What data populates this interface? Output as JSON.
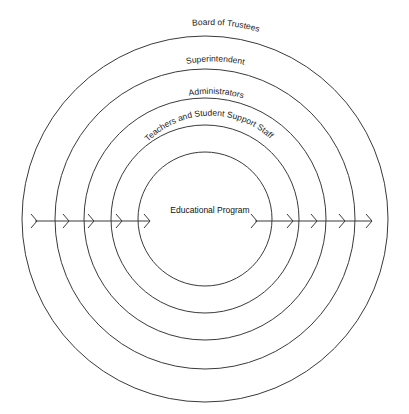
{
  "diagram": {
    "type": "concentric-circles",
    "center": {
      "x": 205,
      "y": 219
    },
    "stroke_color": "#3a3a3a",
    "rings": [
      {
        "label": "Board of Trustees",
        "radius": 183
      },
      {
        "label": "Superintendent",
        "radius": 150
      },
      {
        "label": "Administrators",
        "radius": 121
      },
      {
        "label": "Teachers and Student Support Staff",
        "radius": 94
      }
    ],
    "core": {
      "label": "Educational Program",
      "radius": 67
    },
    "arrows": {
      "direction": "left-to-right",
      "left_segment": {
        "x1": 35,
        "x2": 150,
        "y": 221,
        "chevrons_x": [
          37,
          69,
          94,
          122,
          150
        ]
      },
      "right_segment": {
        "x1": 255,
        "x2": 372,
        "y": 221,
        "chevrons_x": [
          257,
          293,
          317,
          345,
          372
        ]
      }
    }
  }
}
